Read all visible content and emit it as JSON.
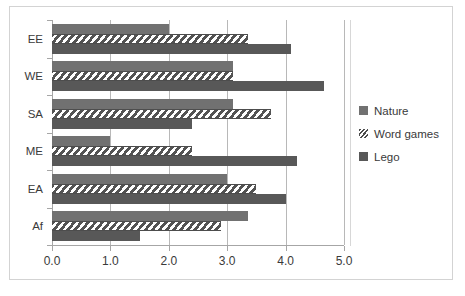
{
  "chart_data": {
    "type": "bar",
    "orientation": "horizontal",
    "title": "",
    "xlabel": "",
    "ylabel": "",
    "categories": [
      "EE",
      "WE",
      "SA",
      "ME",
      "EA",
      "Af"
    ],
    "series": [
      {
        "name": "Nature",
        "values": [
          2.0,
          3.1,
          3.1,
          1.0,
          3.0,
          3.35
        ]
      },
      {
        "name": "Word games",
        "values": [
          3.35,
          3.1,
          3.75,
          2.4,
          3.5,
          2.9
        ]
      },
      {
        "name": "Lego",
        "values": [
          4.1,
          4.65,
          2.4,
          4.2,
          4.0,
          1.5
        ]
      }
    ],
    "xlim": [
      0.0,
      5.0
    ],
    "xticks": [
      "0.0",
      "1.0",
      "2.0",
      "3.0",
      "4.0",
      "5.0"
    ],
    "xtick_values": [
      0.0,
      1.0,
      2.0,
      3.0,
      4.0,
      5.0
    ],
    "grid": "vertical",
    "legend_position": "right"
  },
  "legend": {
    "items": [
      {
        "label": "Nature",
        "swatch": "nature-swatch-icon"
      },
      {
        "label": "Word games",
        "swatch": "word-games-swatch-icon"
      },
      {
        "label": "Lego",
        "swatch": "lego-swatch-icon"
      }
    ]
  },
  "colors": {
    "nature": "#717171",
    "lego": "#585858",
    "word_games_hatch": "#4d4d4d",
    "gridline": "#b8b8b8",
    "axis": "#a6a6a6",
    "border": "#d3d3d3",
    "text": "#3a3a3a",
    "background": "#ffffff"
  }
}
